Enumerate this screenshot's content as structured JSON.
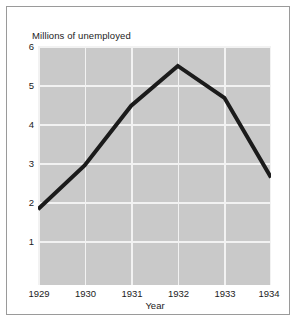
{
  "chart_data": {
    "type": "line",
    "title": "",
    "subtitle": "",
    "xlabel": "Year",
    "ylabel": "Millions of unemployed",
    "categories": [
      "1929",
      "1930",
      "1931",
      "1932",
      "1933",
      "1934"
    ],
    "x": [
      1929,
      1930,
      1931,
      1932,
      1933,
      1934
    ],
    "values": [
      1.9,
      3.0,
      4.5,
      5.5,
      4.7,
      2.7
    ],
    "series": [
      {
        "name": "Unemployed",
        "values": [
          1.9,
          3.0,
          4.5,
          5.5,
          4.7,
          2.7
        ]
      }
    ],
    "xlim": [
      1929,
      1934
    ],
    "ylim": [
      0,
      6
    ],
    "y_ticks": [
      6,
      5,
      4,
      3,
      2,
      1
    ],
    "y_tick_labels": [
      "6",
      "5",
      "4",
      "3",
      "2",
      "1"
    ],
    "x_ticks": [
      1929,
      1930,
      1931,
      1932,
      1933,
      1934
    ],
    "x_tick_labels": [
      "1929",
      "1930",
      "1931",
      "1932",
      "1933",
      "1934"
    ],
    "grid": true,
    "grid_color": "#f2f2f2",
    "legend": false,
    "legend_position": "none",
    "plot_background": "#c9c9c9",
    "line_color": "#1b1b1b",
    "figure_background": "#ffffff",
    "frame_color": "#9a9a9a",
    "annotations": []
  },
  "axis": {
    "y_title": "Millions of unemployed",
    "x_title": "Year",
    "y_labels": [
      "6",
      "5",
      "4",
      "3",
      "2",
      "1"
    ],
    "x_labels": [
      "1929",
      "1930",
      "1931",
      "1932",
      "1933",
      "1934"
    ]
  }
}
